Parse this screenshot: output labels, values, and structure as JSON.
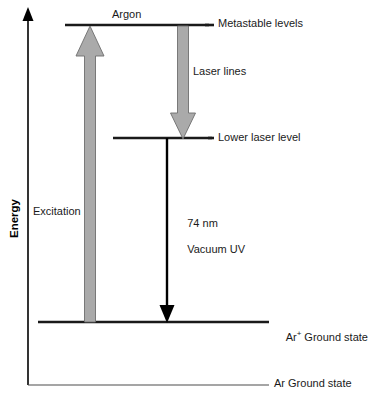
{
  "figure": {
    "kind": "energy-level-diagram",
    "width": 368,
    "height": 399,
    "background_color": "#ffffff"
  },
  "axis": {
    "y_label": "Energy",
    "y_label_rotation_deg": -90,
    "color": "#000000",
    "arrow_at_top": true
  },
  "levels": [
    {
      "id": "metastable",
      "label": "Metastable levels",
      "color": "#1a1a1a",
      "x_start": 65,
      "x_end": 209,
      "y": 25,
      "thickness": 2.6
    },
    {
      "id": "lower-laser",
      "label": "Lower laser level",
      "color": "#1a1a1a",
      "x_start": 113,
      "x_end": 212,
      "y": 138,
      "thickness": 2.6
    },
    {
      "id": "ar-plus-ground",
      "label_prefix": "Ar",
      "label_superscript": "+",
      "label_suffix": " Ground state",
      "color": "#1a1a1a",
      "x_start": 38,
      "x_end": 269,
      "y": 322,
      "thickness": 2.6
    },
    {
      "id": "ar-ground",
      "label": "Ar Ground state",
      "color": "#4d4d4d",
      "x_start": 28,
      "x_end": 269,
      "y": 385,
      "thickness": 1.1
    }
  ],
  "transitions": [
    {
      "id": "excitation",
      "label": "Excitation",
      "direction": "up",
      "style": "filled-gray",
      "fill": "#aaaaaa",
      "stroke": "#6e6e6e",
      "x_center": 90,
      "y_from": 322,
      "y_to": 26,
      "shaft_width": 11,
      "head_width": 28,
      "head_height": 30
    },
    {
      "id": "laser-lines",
      "label": "Laser lines",
      "direction": "down",
      "style": "filled-gray",
      "fill": "#aaaaaa",
      "stroke": "#6e6e6e",
      "x_center": 183,
      "y_from": 26,
      "y_to": 139,
      "shaft_width": 11,
      "head_width": 25,
      "head_height": 26
    },
    {
      "id": "vacuum-uv",
      "label_line1": "74 nm",
      "label_line2": "Vacuum UV",
      "direction": "down",
      "style": "thin-black",
      "stroke": "#000000",
      "x_center": 167,
      "y_from": 138,
      "y_to": 322,
      "shaft_width": 2.4,
      "head_width": 15,
      "head_height": 17
    }
  ],
  "labels": {
    "argon": "Argon",
    "metastable": "Metastable levels",
    "laser_lines": "Laser lines",
    "lower_laser": "Lower laser level",
    "excitation": "Excitation",
    "wavelength": "74 nm",
    "band": "Vacuum UV",
    "ar_plus_ground": "Ar",
    "ar_plus_ground_sup": "+",
    "ar_plus_ground_rest": " Ground state",
    "ar_ground": "Ar Ground state",
    "energy": "Energy"
  }
}
